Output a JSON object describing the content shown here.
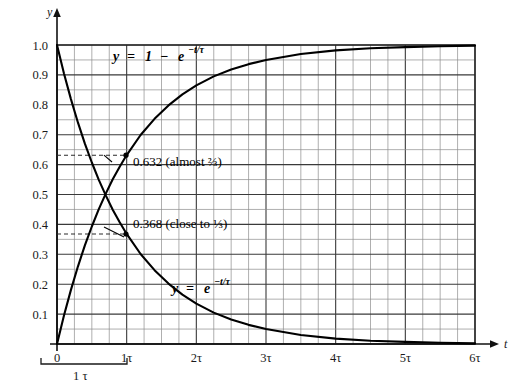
{
  "chart_data": {
    "type": "line",
    "title": "",
    "xlabel": "t",
    "ylabel": "y",
    "xlim": [
      0,
      6
    ],
    "ylim": [
      0,
      1.0
    ],
    "grid": true,
    "legend": "inline-curve-labels",
    "x_tick_labels": [
      "0",
      "1τ",
      "2τ",
      "3τ",
      "4τ",
      "5τ",
      "6τ"
    ],
    "x_tick_values": [
      0,
      1,
      2,
      3,
      4,
      5,
      6
    ],
    "y_tick_labels": [
      "0.1",
      "0.2",
      "0.3",
      "0.4",
      "0.5",
      "0.6",
      "0.7",
      "0.8",
      "0.9",
      "1.0"
    ],
    "y_tick_values": [
      0.1,
      0.2,
      0.3,
      0.4,
      0.5,
      0.6,
      0.7,
      0.8,
      0.9,
      1.0
    ],
    "minor_grid_divisions_x": 4,
    "minor_grid_divisions_y": 2,
    "series": [
      {
        "name": "rising",
        "label": "y = 1 − e−t/τ",
        "formula_html": "<i>y</i> = 1 − <i>e</i><sup>−<i>t</i>/τ</sup>",
        "x": [
          0,
          0.1,
          0.2,
          0.3,
          0.4,
          0.5,
          0.6,
          0.7,
          0.8,
          0.9,
          1.0,
          1.2,
          1.4,
          1.6,
          1.8,
          2.0,
          2.25,
          2.5,
          2.75,
          3.0,
          3.5,
          4.0,
          4.5,
          5.0,
          5.5,
          6.0
        ],
        "y": [
          0.0,
          0.095,
          0.181,
          0.259,
          0.33,
          0.393,
          0.451,
          0.503,
          0.551,
          0.593,
          0.632,
          0.699,
          0.753,
          0.798,
          0.835,
          0.865,
          0.895,
          0.918,
          0.936,
          0.95,
          0.97,
          0.982,
          0.989,
          0.993,
          0.996,
          0.998
        ]
      },
      {
        "name": "decaying",
        "label": "y = e−t/τ",
        "formula_html": "<i>y</i> = <i>e</i><sup>−<i>t</i>/τ</sup>",
        "x": [
          0,
          0.1,
          0.2,
          0.3,
          0.4,
          0.5,
          0.6,
          0.7,
          0.8,
          0.9,
          1.0,
          1.2,
          1.4,
          1.6,
          1.8,
          2.0,
          2.25,
          2.5,
          2.75,
          3.0,
          3.5,
          4.0,
          4.5,
          5.0,
          5.5,
          6.0
        ],
        "y": [
          1.0,
          0.905,
          0.819,
          0.741,
          0.67,
          0.607,
          0.549,
          0.497,
          0.449,
          0.407,
          0.368,
          0.301,
          0.247,
          0.202,
          0.165,
          0.135,
          0.105,
          0.082,
          0.064,
          0.05,
          0.03,
          0.018,
          0.011,
          0.007,
          0.004,
          0.002
        ]
      }
    ],
    "annotations": [
      {
        "name": "value-0632",
        "text": "0.632 (almost ⅔)",
        "at_x": 1.0,
        "at_y": 0.632,
        "guide": "dashed-horizontal-from-y-axis"
      },
      {
        "name": "value-0368",
        "text": "0.368 (close to ⅓)",
        "at_x": 1.0,
        "at_y": 0.368,
        "guide": "dashed-horizontal-from-y-axis"
      }
    ],
    "bracket": {
      "name": "one-tau-bracket",
      "label": "1 τ",
      "from_x": 0,
      "to_x": 1
    }
  },
  "axes": {
    "y_axis_symbol": "y",
    "x_axis_symbol": "t"
  },
  "labels": {
    "rising_curve": {
      "lhs": "y",
      "eq": "=",
      "one": "1",
      "minus": "−",
      "e": "e",
      "exp": "−t/τ"
    },
    "decay_curve": {
      "lhs": "y",
      "eq": "=",
      "e": "e",
      "exp": "−t/τ"
    },
    "annot_632": "0.632 (almost ⅔)",
    "annot_368": "0.368 (close to ⅓)",
    "bracket_text": "1 τ"
  }
}
